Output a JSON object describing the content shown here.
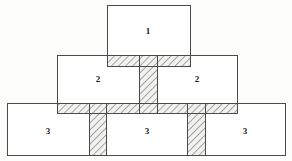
{
  "diagram": {
    "background_color": "#fdfdfb",
    "block_fill_color": "#ffffff",
    "block_stroke_color": "#4a4a4a",
    "hatch_fill_color": "#f2f2f0",
    "hatch_line_color": "#3a3a3a",
    "tiers": [
      {
        "tier_index": 1,
        "name": "top-tier",
        "blocks": [
          {
            "label": "1",
            "x": 107,
            "y": 5,
            "width": 83,
            "height": 61,
            "label_x": 148,
            "label_y": 31
          }
        ]
      },
      {
        "tier_index": 2,
        "name": "middle-tier",
        "blocks": [
          {
            "label": "2",
            "x": 57,
            "y": 55,
            "width": 100,
            "height": 58,
            "label_x": 98,
            "label_y": 79
          },
          {
            "label": "2",
            "x": 139,
            "y": 55,
            "width": 98,
            "height": 58,
            "label_x": 197,
            "label_y": 79
          }
        ]
      },
      {
        "tier_index": 3,
        "name": "bottom-tier",
        "blocks": [
          {
            "label": "3",
            "x": 7,
            "y": 103,
            "width": 99,
            "height": 52,
            "label_x": 48,
            "label_y": 131
          },
          {
            "label": "3",
            "x": 89,
            "y": 103,
            "width": 116,
            "height": 52,
            "label_x": 147,
            "label_y": 131
          },
          {
            "label": "3",
            "x": 187,
            "y": 103,
            "width": 98,
            "height": 52,
            "label_x": 245,
            "label_y": 131
          }
        ]
      }
    ],
    "joints": {
      "horizontal_bands": [
        {
          "name": "upper-bed-joint-left",
          "x": 107,
          "y": 55,
          "width": 32,
          "height": 11
        },
        {
          "name": "upper-bed-joint-right",
          "x": 157,
          "y": 55,
          "width": 33,
          "height": 11
        },
        {
          "name": "lower-bed-joint",
          "x": 57,
          "y": 103,
          "width": 180,
          "height": 10
        }
      ],
      "vertical_columns": [
        {
          "name": "center-head-joint",
          "x": 139,
          "y": 55,
          "width": 18,
          "height": 58
        },
        {
          "name": "left-head-joint",
          "x": 89,
          "y": 103,
          "width": 17,
          "height": 52
        },
        {
          "name": "right-head-joint",
          "x": 187,
          "y": 103,
          "width": 18,
          "height": 52
        }
      ]
    }
  }
}
